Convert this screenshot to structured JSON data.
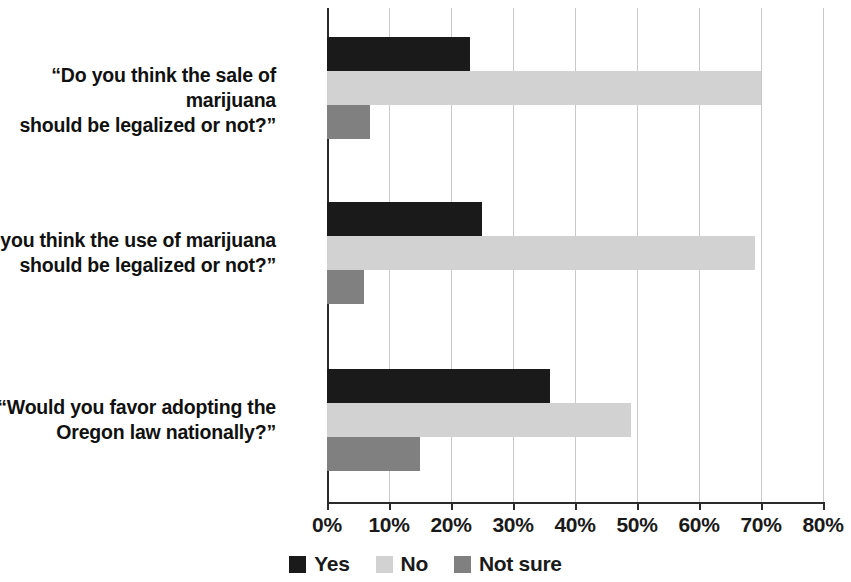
{
  "chart_data": {
    "type": "bar",
    "orientation": "horizontal",
    "title": "",
    "subtitle": "",
    "xlabel": "",
    "ylabel": "",
    "xlim": [
      0,
      80
    ],
    "xtick_step": 10,
    "grid": true,
    "grid_axis": "x",
    "legend_position": "bottom",
    "categories": [
      "“Do you think the sale of marijuana should be legalized or not?”",
      "“Do you think the use of marijuana should be legalized or not?”",
      "“Would you favor adopting the Oregon law nationally?”"
    ],
    "category_lines": [
      [
        "“Do you think the sale of marijuana",
        "should be legalized or not?”"
      ],
      [
        "“Do you think the use of marijuana",
        "should be legalized or not?”"
      ],
      [
        "“Would you favor adopting the",
        "Oregon law nationally?”"
      ]
    ],
    "series": [
      {
        "name": "Yes",
        "color": "#1a1a1a",
        "values": [
          23,
          25,
          36
        ]
      },
      {
        "name": "No",
        "color": "#d2d2d2",
        "values": [
          70,
          69,
          49
        ]
      },
      {
        "name": "Not sure",
        "color": "#808080",
        "values": [
          7,
          6,
          15
        ]
      }
    ],
    "xticks": [
      0,
      10,
      20,
      30,
      40,
      50,
      60,
      70,
      80
    ],
    "xtick_labels": [
      "0%",
      "10%",
      "20%",
      "30%",
      "40%",
      "50%",
      "60%",
      "70%",
      "80%"
    ]
  },
  "legend": {
    "items": [
      {
        "label": "Yes",
        "color": "#1a1a1a"
      },
      {
        "label": "No",
        "color": "#d2d2d2"
      },
      {
        "label": "Not sure",
        "color": "#808080"
      }
    ]
  },
  "axis": {
    "origin_color": "#2b2b2b",
    "grid_color": "#c9c9c9"
  }
}
